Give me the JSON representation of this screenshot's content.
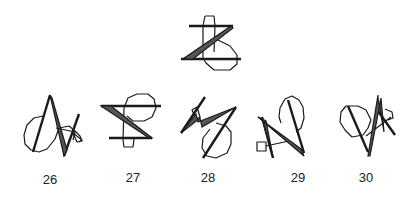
{
  "figure": {
    "reference": {
      "name": "target-figure"
    },
    "options": [
      {
        "label": "26"
      },
      {
        "label": "27"
      },
      {
        "label": "28"
      },
      {
        "label": "29"
      },
      {
        "label": "30"
      }
    ]
  }
}
